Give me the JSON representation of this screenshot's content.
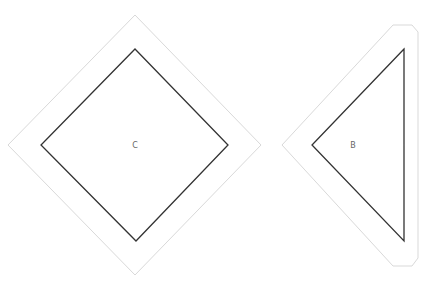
{
  "shapes": [
    {
      "id": "C",
      "label": "C",
      "type": "square-rotated-45",
      "inner_points": "135,49 228,145 136,241 41,145",
      "outer_points": "135,15 261,145 135,275 8,145",
      "label_x": 135,
      "label_y": 148
    },
    {
      "id": "B",
      "label": "B",
      "type": "triangle",
      "inner_points": "404,49 312,145 404,241",
      "outer_points": "282,145 393,25 412,25 418,32 418,258 412,266 393,266",
      "label_x": 353,
      "label_y": 148
    }
  ],
  "colors": {
    "outer_stroke": "#d9d9d9",
    "inner_stroke": "#333333",
    "label": "#666666",
    "background": "#ffffff"
  }
}
